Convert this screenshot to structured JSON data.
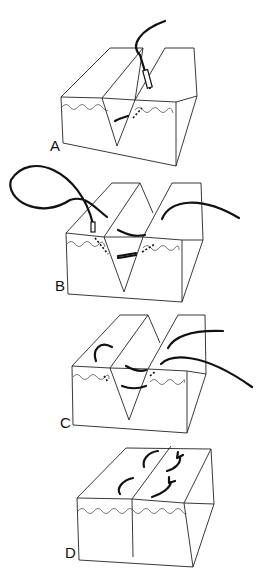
{
  "figure": {
    "panels": [
      {
        "id": "A",
        "label": "A",
        "description": "V-shaped wound with needle passing through deep layer"
      },
      {
        "id": "B",
        "label": "B",
        "description": "Suture loop passed across both wound edges at dermal level"
      },
      {
        "id": "C",
        "label": "C",
        "description": "Suture ends brought up through both sides before tying"
      },
      {
        "id": "D",
        "label": "D",
        "description": "Wound closed with buried sutures tied"
      }
    ],
    "colors": {
      "line": "#222222",
      "suture": "#111111",
      "background": "#ffffff"
    }
  }
}
